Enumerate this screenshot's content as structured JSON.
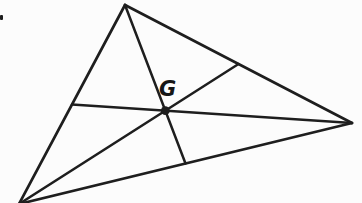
{
  "diagram": {
    "point_label": "G",
    "ink_color": "#1e1e1e",
    "paper_color": "#fcfcfc",
    "canvas": {
      "width": 362,
      "height": 203
    },
    "triangle_vertices": {
      "top": {
        "x": 125,
        "y": 5
      },
      "right": {
        "x": 352,
        "y": 123
      },
      "bottom_left": {
        "x": 19,
        "y": 204
      }
    },
    "lines": {
      "side_left": [
        125,
        5,
        19,
        204
      ],
      "side_top_right": [
        125,
        5,
        352,
        123
      ],
      "side_bottom": [
        19,
        204,
        352,
        123
      ],
      "median_from_top": [
        125,
        5,
        185.5,
        163.5
      ],
      "median_from_right": [
        352,
        123,
        72,
        104.5
      ],
      "median_from_bottom_left": [
        19,
        204,
        238.5,
        64
      ]
    },
    "centroid": {
      "x": 165.3,
      "y": 110.7,
      "radius": 4.4
    },
    "label_anchor": {
      "x": 159,
      "y": 96
    },
    "corner_mark": {
      "x": 0,
      "y": 15,
      "width": 3,
      "height": 5
    }
  }
}
